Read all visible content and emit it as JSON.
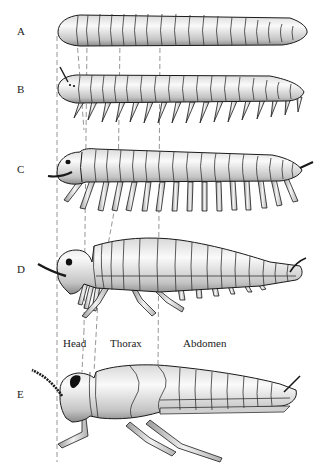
{
  "figure": {
    "stages": [
      {
        "id": "A",
        "label": "A",
        "form": "legless segmented worm"
      },
      {
        "id": "B",
        "label": "B",
        "form": "segmented body with simple legs and antenna"
      },
      {
        "id": "C",
        "label": "C",
        "form": "many-legged arthropod with head"
      },
      {
        "id": "D",
        "label": "D",
        "form": "head/thorax differentiation, reduced abdominal legs"
      },
      {
        "id": "E",
        "label": "E",
        "form": "insect with three thoracic leg pairs"
      }
    ],
    "regions": {
      "head": "Head",
      "thorax": "Thorax",
      "abdomen": "Abdomen"
    },
    "colors": {
      "outline": "#1a1a1a",
      "body_light": "#f4f4f4",
      "body_shade": "#a8a8a8",
      "dash": "#888888"
    }
  }
}
